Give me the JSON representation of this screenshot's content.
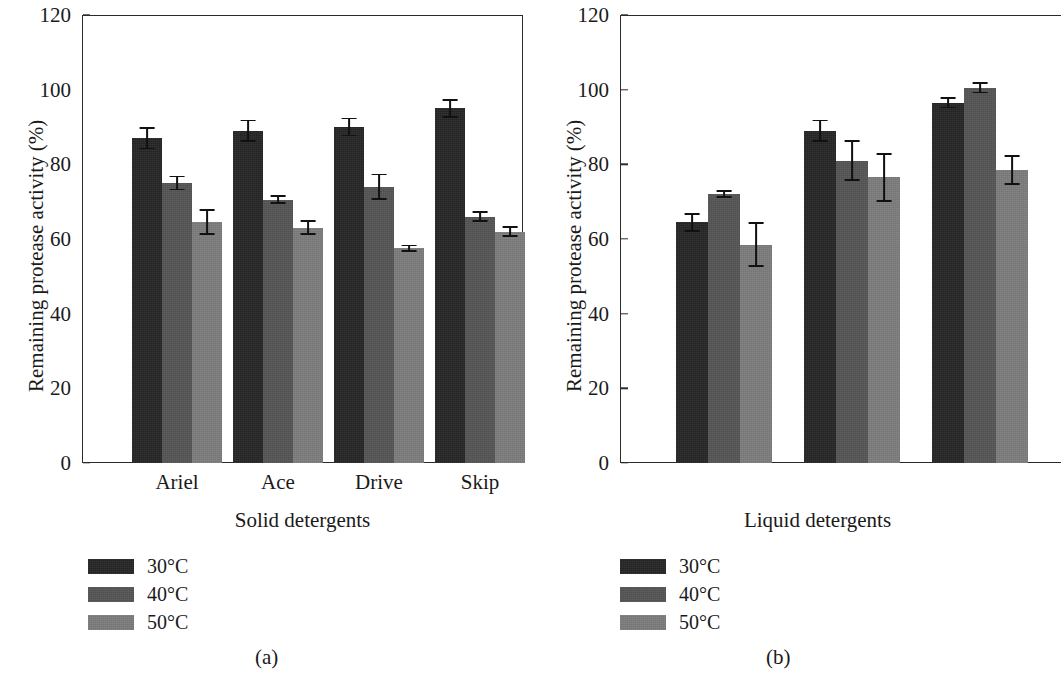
{
  "chart_data": [
    {
      "panel": "(a)",
      "type": "bar",
      "title": "",
      "xlabel": "Solid detergents",
      "ylabel": "Remaining protease activity (%)",
      "ylim": [
        0,
        120
      ],
      "yticks": [
        0,
        20,
        40,
        60,
        80,
        100,
        120
      ],
      "grid": false,
      "legend_position": "below-left",
      "categories": [
        "Ariel",
        "Ace",
        "Drive",
        "Skip"
      ],
      "series": [
        {
          "name": "30°C",
          "color": "#262626",
          "values": [
            87,
            89,
            90,
            95
          ],
          "errors": [
            3,
            3,
            2.5,
            2.5
          ]
        },
        {
          "name": "40°C",
          "color": "#555555",
          "values": [
            75,
            70.5,
            74,
            66
          ],
          "errors": [
            2,
            1.2,
            3.5,
            1.5
          ]
        },
        {
          "name": "50°C",
          "color": "#7d7d7d",
          "values": [
            64.5,
            63,
            57.5,
            62
          ],
          "errors": [
            3.5,
            2,
            1,
            1.5
          ]
        }
      ]
    },
    {
      "panel": "(b)",
      "type": "bar",
      "title": "",
      "xlabel": "Liquid detergents",
      "ylabel": "Remaining protease activity (%)",
      "ylim": [
        0,
        120
      ],
      "yticks": [
        0,
        20,
        40,
        60,
        80,
        100,
        120
      ],
      "grid": false,
      "legend_position": "below-left",
      "categories": [
        "Ace liq",
        "Ariel liq",
        "Pre-wash"
      ],
      "series": [
        {
          "name": "30°C",
          "color": "#262626",
          "values": [
            64.5,
            89,
            96.5
          ],
          "errors": [
            2.5,
            3,
            1.5
          ]
        },
        {
          "name": "40°C",
          "color": "#555555",
          "values": [
            72,
            81,
            100.5
          ],
          "errors": [
            1,
            5.5,
            1.5
          ]
        },
        {
          "name": "50°C",
          "color": "#7d7d7d",
          "values": [
            58.5,
            76.5,
            78.5
          ],
          "errors": [
            6,
            6.5,
            4
          ]
        }
      ]
    }
  ],
  "panel_a": {
    "caption": "(a)",
    "xlabel": "Solid detergents",
    "ylabel": "Remaining protease activity (%)",
    "yticks": [
      "120",
      "100",
      "80",
      "60",
      "40",
      "20",
      "0"
    ],
    "categories": [
      "Ariel",
      "Ace",
      "Drive",
      "Skip"
    ],
    "legend": [
      {
        "label": "30°C",
        "color": "#262626"
      },
      {
        "label": "40°C",
        "color": "#555555"
      },
      {
        "label": "50°C",
        "color": "#7d7d7d"
      }
    ]
  },
  "panel_b": {
    "caption": "(b)",
    "xlabel": "Liquid detergents",
    "ylabel": "Remaining protease activity (%)",
    "yticks": [
      "120",
      "100",
      "80",
      "60",
      "40",
      "20",
      "0"
    ],
    "categories": [
      "Ace liq",
      "Ariel liq",
      "Pre-wash"
    ],
    "legend": [
      {
        "label": "30°C",
        "color": "#262626"
      },
      {
        "label": "40°C",
        "color": "#555555"
      },
      {
        "label": "50°C",
        "color": "#7d7d7d"
      }
    ]
  }
}
